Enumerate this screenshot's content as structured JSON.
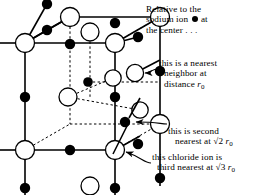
{
  "figure": {
    "ion_colors": {
      "sodium": "#000000",
      "chloride": "#ffffff",
      "outline": "#000000"
    }
  },
  "annotations": {
    "a": {
      "name": "relative-to-sodium-note",
      "line1": "Relative to the",
      "line2_pre": "sodium ion",
      "line2_post": "at",
      "line3": "the center . . ."
    },
    "b": {
      "name": "nearest-neighbor-note",
      "line1": "this is a nearest",
      "line2": "neighbor  at",
      "line3_pre": "distance ",
      "line3_r": "r",
      "line3_sub": "0"
    },
    "c": {
      "name": "second-nearest-note",
      "line1": "this is second",
      "line2_pre": "nearest at  ",
      "line2_radical": "√2",
      "line2_r": " r",
      "line2_sub": "0"
    },
    "d": {
      "name": "third-nearest-note",
      "line1": "this chloride ion is",
      "line2_pre": "third  nearest at ",
      "line2_radical": "√3",
      "line2_r": " r",
      "line2_sub": "0"
    }
  },
  "lattice": {
    "cube_front": [
      [
        25,
        43
      ],
      [
        115,
        43
      ],
      [
        115,
        150
      ],
      [
        25,
        150
      ]
    ],
    "cube_back": [
      [
        70,
        17
      ],
      [
        160,
        17
      ],
      [
        160,
        124
      ],
      [
        70,
        124
      ]
    ],
    "sodium_ions": [
      [
        47,
        30
      ],
      [
        70,
        44
      ],
      [
        115,
        23
      ],
      [
        138,
        37
      ],
      [
        25,
        97
      ],
      [
        70,
        83
      ],
      [
        115,
        97
      ],
      [
        160,
        71
      ],
      [
        70,
        150
      ],
      [
        88,
        82
      ],
      [
        125,
        122
      ],
      [
        138,
        144
      ],
      [
        25,
        188
      ],
      [
        115,
        188
      ],
      [
        47,
        4
      ],
      [
        160,
        178
      ]
    ],
    "chloride_ions": [
      [
        25,
        43
      ],
      [
        115,
        43
      ],
      [
        70,
        17
      ],
      [
        160,
        17
      ],
      [
        25,
        150
      ],
      [
        115,
        150
      ],
      [
        70,
        124
      ],
      [
        160,
        124
      ],
      [
        90,
        32
      ],
      [
        135,
        73
      ],
      [
        68,
        97
      ],
      [
        113,
        78
      ],
      [
        140,
        110
      ],
      [
        90,
        186
      ]
    ],
    "r0_label": "r0"
  }
}
